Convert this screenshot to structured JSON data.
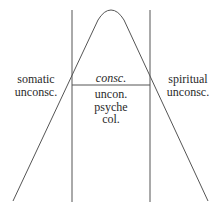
{
  "diagram": {
    "left_region": {
      "line1": "somatic",
      "line2": "unconsc."
    },
    "right_region": {
      "line1": "spiritual",
      "line2": "unconsc."
    },
    "center_region": {
      "top_label": "consc.",
      "lines": [
        "uncon.",
        "psyche",
        "col."
      ]
    },
    "colors": {
      "line": "#555555",
      "text": "#2a2a2a",
      "background": "#ffffff"
    }
  }
}
